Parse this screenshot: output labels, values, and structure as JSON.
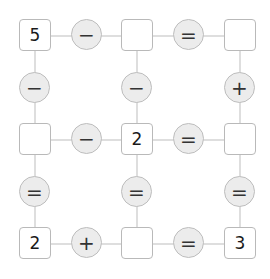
{
  "puzzle": {
    "rows": [
      {
        "cells": [
          "5",
          "",
          ""
        ],
        "ops": [
          "−",
          "="
        ]
      },
      {
        "cells": [
          "",
          "2",
          ""
        ],
        "ops": [
          "−",
          "="
        ]
      },
      {
        "cells": [
          "2",
          "",
          "3"
        ],
        "ops": [
          "+",
          "="
        ]
      }
    ],
    "column_ops": [
      [
        "−",
        "−",
        "+"
      ],
      [
        "=",
        "=",
        "="
      ]
    ]
  },
  "colors": {
    "cell_border": "#b9b9b9",
    "op_fill": "#ececec",
    "op_border": "#bdbdbd",
    "connector": "#dedede"
  }
}
